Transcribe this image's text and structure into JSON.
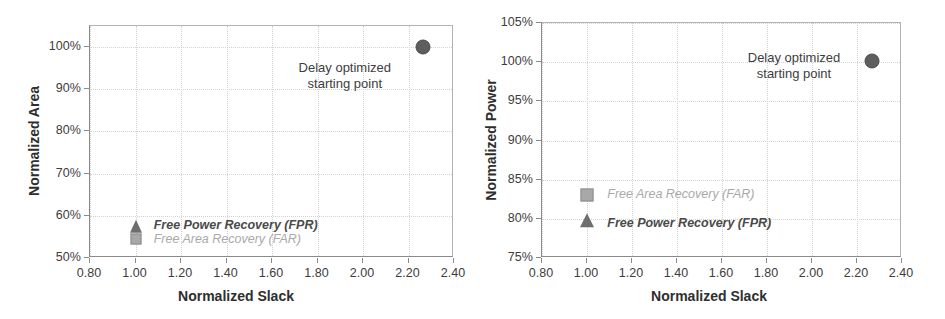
{
  "figure": {
    "background_color": "#ffffff",
    "ink_color": "#3a3a3a"
  },
  "chart_data": [
    {
      "id": "left",
      "type": "scatter",
      "title": "",
      "xlabel": "Normalized Slack",
      "ylabel": "Normalized Area",
      "xlim": [
        0.8,
        2.4
      ],
      "ylim": [
        50,
        105
      ],
      "ytick_suffix": "%",
      "xticks": [
        "0.80",
        "1.00",
        "1.20",
        "1.40",
        "1.60",
        "1.80",
        "2.00",
        "2.20",
        "2.40"
      ],
      "xtick_values": [
        0.8,
        1.0,
        1.2,
        1.4,
        1.6,
        1.8,
        2.0,
        2.2,
        2.4
      ],
      "yticks": [
        "50%",
        "60%",
        "70%",
        "80%",
        "90%",
        "100%"
      ],
      "ytick_values": [
        50,
        60,
        70,
        80,
        90,
        100
      ],
      "grid": "dotted-both",
      "legend_position": "inline-annotations",
      "points": [
        {
          "name": "Delay optimized starting point",
          "marker": "circle",
          "color": "#5e5e5e",
          "size": 15,
          "x": 2.265,
          "y": 100.0
        },
        {
          "name": "Free Power Recovery (FPR)",
          "marker": "triangle",
          "color": "#6e6e6e",
          "size": 13,
          "x": 1.0,
          "y": 57.3
        },
        {
          "name": "Free Area Recovery (FAR)",
          "marker": "square",
          "color": "#a8a8a8",
          "size": 11,
          "x": 1.0,
          "y": 54.4
        }
      ],
      "annotations": [
        {
          "id": "delay-start",
          "line1": "Delay optimized",
          "line2": "starting point",
          "anchor_x": 1.92,
          "anchor_y": 97.0
        },
        {
          "id": "fpr",
          "text": "Free Power Recovery (FPR)",
          "anchor_x": 1.08,
          "anchor_y": 57.6
        },
        {
          "id": "far",
          "text": "Free Area Recovery (FAR)",
          "anchor_x": 1.08,
          "anchor_y": 54.2
        }
      ]
    },
    {
      "id": "right",
      "type": "scatter",
      "title": "",
      "xlabel": "Normalized Slack",
      "ylabel": "Normalized Power",
      "xlim": [
        0.8,
        2.4
      ],
      "ylim": [
        75,
        105
      ],
      "ytick_suffix": "%",
      "xticks": [
        "0.80",
        "1.00",
        "1.20",
        "1.40",
        "1.60",
        "1.80",
        "2.00",
        "2.20",
        "2.40"
      ],
      "xtick_values": [
        0.8,
        1.0,
        1.2,
        1.4,
        1.6,
        1.8,
        2.0,
        2.2,
        2.4
      ],
      "yticks": [
        "75%",
        "80%",
        "85%",
        "90%",
        "95%",
        "100%",
        "105%"
      ],
      "ytick_values": [
        75,
        80,
        85,
        90,
        95,
        100,
        105
      ],
      "grid": "dotted-both",
      "legend_position": "inline-annotations",
      "points": [
        {
          "name": "Delay optimized starting point",
          "marker": "circle",
          "color": "#5e5e5e",
          "size": 15,
          "x": 2.265,
          "y": 100.2
        },
        {
          "name": "Free Area Recovery (FAR)",
          "marker": "square",
          "color": "#a8a8a8",
          "size": 13,
          "x": 1.0,
          "y": 83.0
        },
        {
          "name": "Free Power Recovery (FPR)",
          "marker": "triangle",
          "color": "#6e6e6e",
          "size": 14,
          "x": 1.0,
          "y": 79.7
        }
      ],
      "annotations": [
        {
          "id": "delay-start",
          "line1": "Delay optimized",
          "line2": "starting point",
          "anchor_x": 1.92,
          "anchor_y": 101.6
        },
        {
          "id": "far",
          "text": "Free Area Recovery (FAR)",
          "anchor_x": 1.09,
          "anchor_y": 83.0
        },
        {
          "id": "fpr",
          "text": "Free Power Recovery (FPR)",
          "anchor_x": 1.09,
          "anchor_y": 79.4
        }
      ]
    }
  ]
}
